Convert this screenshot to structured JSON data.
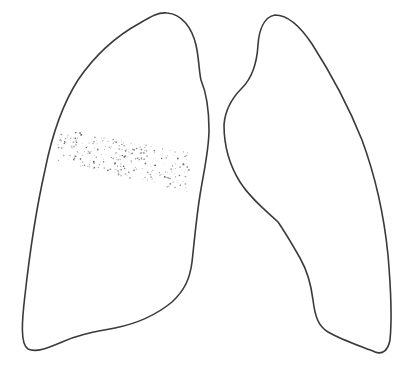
{
  "figure": {
    "title": "Lung outline diagram with stippled opacity",
    "background": "#ffffff",
    "stroke_color": "#3a3a3a",
    "stipple_color": "#555555",
    "lungs": [
      {
        "id": "right-lung",
        "position": "viewer-left",
        "path": "M167,13 C182,14 192,28 196,45 C199,58 199,72 201,80 C206,92 209,110 209,130 C209,150 204,170 200,195 C196,220 194,245 192,262 C190,278 185,290 172,302 C155,316 135,324 115,328 C95,332 80,334 62,342 C48,348 36,353 28,349 C20,344 22,320 25,295 C30,250 36,210 45,170 C52,135 62,105 78,80 C95,55 118,35 140,23 C150,17 158,12 167,13 Z",
        "opacity_region": {
          "label": "stippled-opacity",
          "bounds": {
            "x": 55,
            "y": 120,
            "width": 140,
            "height": 75
          }
        }
      },
      {
        "id": "left-lung",
        "position": "viewer-right",
        "path": "M275,15 C288,15 300,26 312,44 C330,72 348,105 362,140 C376,178 384,215 388,255 C391,290 392,320 390,340 C388,350 383,355 375,352 C360,346 342,340 328,332 C318,326 315,316 313,300 C311,284 308,272 300,258 C292,244 285,232 278,222 C265,210 250,198 240,182 C230,166 224,145 224,125 C225,110 232,98 242,88 C252,78 257,62 258,45 C259,30 264,17 275,15 Z"
      }
    ]
  }
}
